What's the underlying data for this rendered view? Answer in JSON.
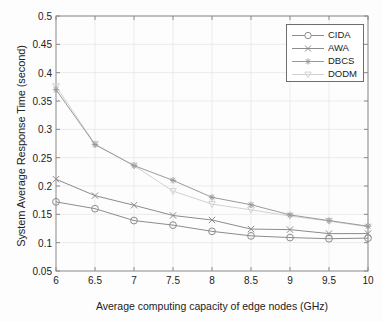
{
  "chart_data": {
    "type": "line",
    "title": "",
    "xlabel": "Average computing capacity of edge nodes (GHz)",
    "ylabel": "System Average Response Time (second)",
    "x": [
      6,
      6.5,
      7,
      7.5,
      8,
      8.5,
      9,
      9.5,
      10
    ],
    "xlim": [
      6,
      10
    ],
    "ylim": [
      0.05,
      0.5
    ],
    "xticks": [
      "6",
      "6.5",
      "7",
      "7.5",
      "8",
      "8.5",
      "9",
      "9.5",
      "10"
    ],
    "yticks": [
      "0.05",
      "0.1",
      "0.15",
      "0.2",
      "0.25",
      "0.3",
      "0.35",
      "0.4",
      "0.45",
      "0.5"
    ],
    "grid": true,
    "legend_position": "upper right",
    "series": [
      {
        "name": "CIDA",
        "marker": "circle",
        "color": "#8c8c8c",
        "values": [
          0.172,
          0.16,
          0.139,
          0.131,
          0.12,
          0.112,
          0.109,
          0.107,
          0.108
        ]
      },
      {
        "name": "AWA",
        "marker": "x",
        "color": "#8c8c8c",
        "values": [
          0.212,
          0.183,
          0.166,
          0.148,
          0.14,
          0.124,
          0.123,
          0.116,
          0.116
        ]
      },
      {
        "name": "DBCS",
        "marker": "asterisk",
        "color": "#9a9a9a",
        "values": [
          0.37,
          0.273,
          0.236,
          0.21,
          0.18,
          0.167,
          0.149,
          0.139,
          0.129
        ]
      },
      {
        "name": "DODM",
        "marker": "triangle-down",
        "color": "#d2d2d2",
        "values": [
          0.376,
          0.274,
          0.236,
          0.191,
          0.168,
          0.158,
          0.147,
          0.138,
          0.128
        ]
      }
    ]
  },
  "legend": {
    "items": [
      {
        "label": "CIDA"
      },
      {
        "label": "AWA"
      },
      {
        "label": "DBCS"
      },
      {
        "label": "DODM"
      }
    ]
  },
  "axes": {
    "colors": {
      "axis": "#8a8a8a",
      "grid": "#e4e4e4",
      "text": "#222222"
    }
  }
}
